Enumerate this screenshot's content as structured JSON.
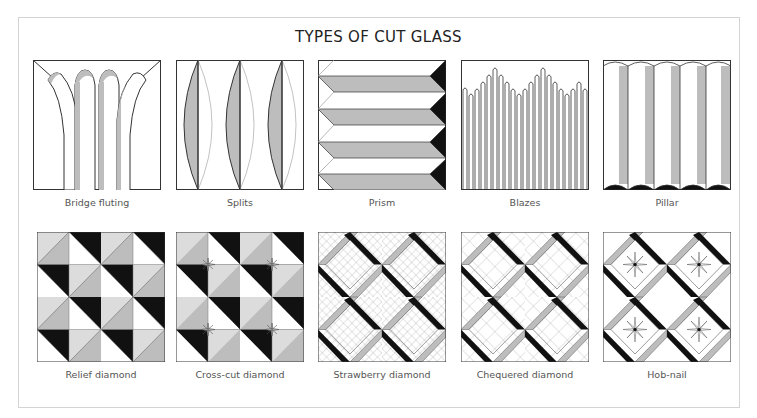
{
  "title": "TYPES OF CUT GLASS",
  "colors": {
    "black": "#111111",
    "grey": "#bdbdbd",
    "light_grey": "#dcdcdc",
    "line": "#333333",
    "frame": "#d4d4d4"
  },
  "rows": [
    {
      "tiles": [
        {
          "id": "bridge-fluting",
          "label": "Bridge fluting"
        },
        {
          "id": "splits",
          "label": "Splits"
        },
        {
          "id": "prism",
          "label": "Prism"
        },
        {
          "id": "blazes",
          "label": "Blazes"
        },
        {
          "id": "pillar",
          "label": "Pillar"
        }
      ]
    },
    {
      "tiles": [
        {
          "id": "relief-diamond",
          "label": "Relief diamond"
        },
        {
          "id": "cross-cut-diamond",
          "label": "Cross-cut diamond"
        },
        {
          "id": "strawberry-diamond",
          "label": "Strawberry diamond"
        },
        {
          "id": "chequered-diamond",
          "label": "Chequered diamond"
        },
        {
          "id": "hob-nail",
          "label": "Hob-nail"
        }
      ]
    }
  ]
}
